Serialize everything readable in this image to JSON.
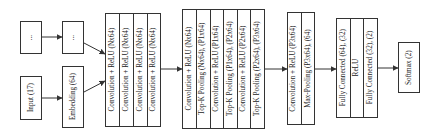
{
  "diagram": {
    "title": "",
    "nodes": {
      "ellipsis_1": {
        "label": "..."
      },
      "ellipsis_2": {
        "label": "..."
      },
      "input": {
        "label": "Input (17)"
      },
      "embedding": {
        "label": "Embedding (64)"
      },
      "conv_block_1": {
        "layers": [
          "Convolution + ReLU (Nx64)",
          "Convolution + ReLU (Nx64)",
          "Convolution + ReLU (Nx64)",
          "Convolution + ReLU (Nx64)"
        ]
      },
      "conv_block_2": {
        "layers": [
          "Convolution + ReLU (Nx64)",
          "Top-K Pooling (Nx64), (P1x64)",
          "Convolution + ReLU (P1x64)",
          "Top-K Pooling (P1x64), (P2x64)",
          "Convolution + ReLU (P2x64)",
          "Top-K Pooling (P2x64), (P3x64)"
        ]
      },
      "conv_block_3": {
        "layers": [
          "Convolution + ReLU (P3x64)",
          "Max-Pooling (P3x64), (64)"
        ]
      },
      "fc_block": {
        "layers": [
          "Fully Connected (64), (32)",
          "ReLU",
          "Fully Connected (32), (2)"
        ]
      },
      "softmax": {
        "label": "Softmax (2)"
      }
    },
    "edges": [
      [
        "ellipsis_1",
        "ellipsis_2"
      ],
      [
        "input",
        "embedding"
      ],
      [
        "ellipsis_2",
        "conv_block_1"
      ],
      [
        "embedding",
        "conv_block_1"
      ],
      [
        "conv_block_1",
        "conv_block_2"
      ],
      [
        "conv_block_2",
        "conv_block_3"
      ],
      [
        "conv_block_3",
        "fc_block"
      ],
      [
        "fc_block",
        "softmax"
      ]
    ],
    "colors": {
      "stroke": "#333333",
      "fill": "#ffffff"
    }
  }
}
